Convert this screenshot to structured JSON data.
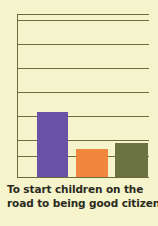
{
  "figure": {
    "background_color": "#f6f4cd",
    "axis_color": "#6e6b3a",
    "caption_color": "#2b2a20"
  },
  "caption": {
    "full_text": "To start children on the road to being good citizens",
    "line1": "To start children on the",
    "line2": "road to being good citizens"
  },
  "chart_data": {
    "type": "bar",
    "title": "To start children on the road to being good citizens",
    "xlabel": "",
    "ylabel": "",
    "categories": [
      "Series 1",
      "Series 2",
      "Series 3"
    ],
    "values": [
      4.0,
      1.7,
      2.1
    ],
    "ylim": [
      0,
      10
    ],
    "grid": true,
    "gridlines_y": [
      10.0,
      9.6,
      8.1,
      6.6,
      5.2,
      3.7,
      2.3,
      1.3
    ],
    "legend": "none",
    "colors": [
      "#6b50a8",
      "#f0873c",
      "#6b7342"
    ],
    "series": [
      {
        "name": "Series 1",
        "value": 4.0,
        "color": "#6b50a8"
      },
      {
        "name": "Series 2",
        "value": 1.7,
        "color": "#f0873c"
      },
      {
        "name": "Series 3",
        "value": 2.1,
        "color": "#6b7342"
      }
    ]
  }
}
